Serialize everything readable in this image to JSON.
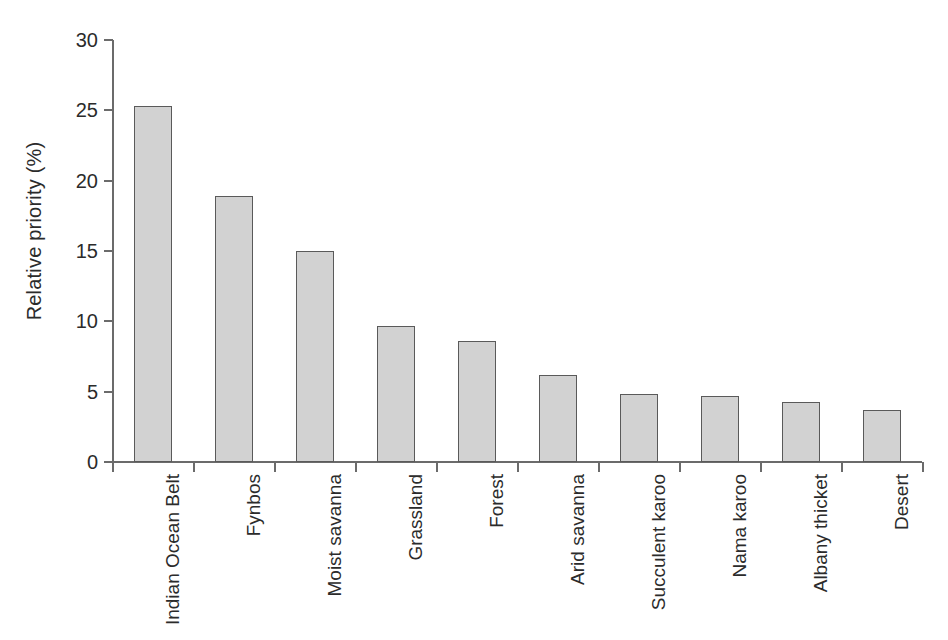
{
  "chart_data": {
    "type": "bar",
    "title": "",
    "subtitle": "",
    "xlabel": "",
    "ylabel": "Relative priority (%)",
    "ylim": [
      0,
      30
    ],
    "ytick_values": [
      0,
      5,
      10,
      15,
      20,
      25,
      30
    ],
    "ytick_labels": [
      "0",
      "5",
      "10",
      "15",
      "20",
      "25",
      "30"
    ],
    "grid": false,
    "legend": false,
    "legend_position": "none",
    "orientation": "vertical",
    "categories": [
      "Indian Ocean Belt",
      "Fynbos",
      "Moist savanna",
      "Grassland",
      "Forest",
      "Arid savanna",
      "Succulent karoo",
      "Nama karoo",
      "Albany thicket",
      "Desert"
    ],
    "values": [
      25.3,
      18.9,
      15.0,
      9.7,
      8.6,
      6.2,
      4.85,
      4.7,
      4.3,
      3.7
    ],
    "series": [
      {
        "name": "Relative priority",
        "values": [
          25.3,
          18.9,
          15.0,
          9.7,
          8.6,
          6.2,
          4.85,
          4.7,
          4.3,
          3.7
        ]
      }
    ],
    "annotations": []
  },
  "style": {
    "bar_fill": "#d2d2d2",
    "bar_border": "#5a5a5a",
    "axis_color": "#6b6b6b",
    "text_color": "#2b2b2b",
    "background": "#ffffff"
  }
}
